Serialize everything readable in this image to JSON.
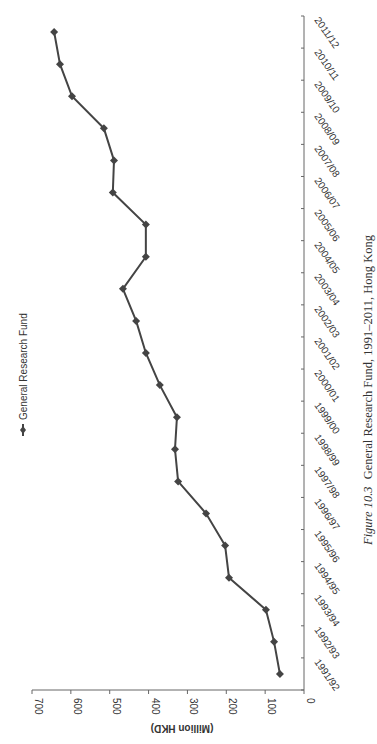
{
  "chart_data": {
    "type": "line",
    "orientation": "rotated-90-clockwise",
    "title": "",
    "xlabel": "",
    "ylabel": "(Million HKD)",
    "ylim": [
      0,
      700
    ],
    "yticks": [
      0,
      100,
      200,
      300,
      400,
      500,
      600,
      700
    ],
    "grid": false,
    "legend_position": "top-left (rotated)",
    "categories": [
      "1991/92",
      "1992/93",
      "1993/94",
      "1994/95",
      "1995/96",
      "1996/97",
      "1997/98",
      "1998/99",
      "1999/00",
      "2000/01",
      "2001/02",
      "2002/03",
      "2003/04",
      "2004/05",
      "2005/06",
      "2006/07",
      "2007/08",
      "2008/09",
      "2009/10",
      "2010/11",
      "2011/12"
    ],
    "series": [
      {
        "name": "General Research Fund",
        "marker": "diamond",
        "color": "#444444",
        "values": [
          62,
          77,
          98,
          193,
          203,
          252,
          324,
          332,
          327,
          371,
          407,
          432,
          466,
          407,
          407,
          492,
          489,
          515,
          597,
          628,
          643
        ]
      }
    ]
  },
  "legend": {
    "label": "General Research Fund"
  },
  "axis": {
    "y_title": "(Million HKD)"
  },
  "caption": {
    "figure_label": "Figure 10.3",
    "text": "General Research Fund, 1991–2011, Hong Kong"
  }
}
